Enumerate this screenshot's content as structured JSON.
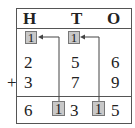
{
  "headers": [
    "H",
    "T",
    "O"
  ],
  "carries_top": [
    "1",
    "1"
  ],
  "row1": [
    "2",
    "5",
    "6"
  ],
  "row2": [
    "3",
    "7",
    "9"
  ],
  "operator": "+",
  "result": {
    "H": "6",
    "carry_H": "1",
    "T": "3",
    "carry_T": "1",
    "O": "5"
  },
  "colors": {
    "carry_box": "#c8c8c8",
    "line": "#555555"
  }
}
